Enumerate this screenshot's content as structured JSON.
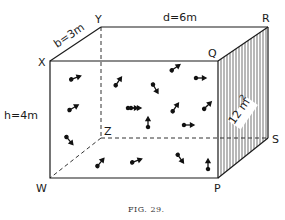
{
  "figure": {
    "caption": "FIG. 29.",
    "vertices": {
      "X": "X",
      "Y": "Y",
      "Q": "Q",
      "R": "R",
      "W": "W",
      "P": "P",
      "S": "S",
      "Z": "Z"
    },
    "dimensions": {
      "breadth": "b=3m",
      "depth": "d=6m",
      "height": "h=4m",
      "face_area": "12 m",
      "face_area_exponent": "2"
    },
    "colors": {
      "line": "#1a1a1a",
      "background": "#ffffff"
    },
    "molecules": [
      {
        "x": 75,
        "y": 78,
        "angle": -20
      },
      {
        "x": 118,
        "y": 82,
        "angle": -55
      },
      {
        "x": 73,
        "y": 108,
        "angle": -30
      },
      {
        "x": 135,
        "y": 108,
        "angle": 0
      },
      {
        "x": 175,
        "y": 68,
        "angle": -35
      },
      {
        "x": 200,
        "y": 78,
        "angle": 0
      },
      {
        "x": 155,
        "y": 88,
        "angle": 60
      },
      {
        "x": 132,
        "y": 108,
        "angle": 0
      },
      {
        "x": 175,
        "y": 108,
        "angle": -55
      },
      {
        "x": 207,
        "y": 106,
        "angle": -45
      },
      {
        "x": 148,
        "y": 123,
        "angle": -90
      },
      {
        "x": 188,
        "y": 125,
        "angle": 0
      },
      {
        "x": 69,
        "y": 140,
        "angle": 50
      },
      {
        "x": 100,
        "y": 163,
        "angle": -50
      },
      {
        "x": 136,
        "y": 161,
        "angle": -20
      },
      {
        "x": 180,
        "y": 158,
        "angle": 55
      },
      {
        "x": 208,
        "y": 165,
        "angle": -90
      }
    ]
  }
}
